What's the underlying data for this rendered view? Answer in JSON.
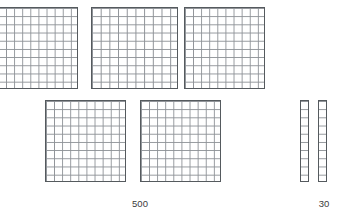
{
  "scene": {
    "title": "Base-ten blocks place value model",
    "background_color": "#ffffff",
    "block_border_color": "#555a5e",
    "block_grid_color": "#8d9196",
    "block_fill_color": "#ffffff",
    "label_color": "#3b3b3b"
  },
  "groups": [
    {
      "id": "hundreds-group",
      "name": "hundreds-flats",
      "piece_type": "flat",
      "piece_value": 100,
      "piece_count": 5,
      "label": "500",
      "label_x": 122,
      "label_y": 198,
      "label_width": 36,
      "grid_rows": 10,
      "grid_cols": 10,
      "pieces": [
        {
          "id": "flat-1",
          "x": -3,
          "y": 7,
          "width": 81,
          "height": 82
        },
        {
          "id": "flat-2",
          "x": 91,
          "y": 7,
          "width": 87,
          "height": 82
        },
        {
          "id": "flat-3",
          "x": 184,
          "y": 7,
          "width": 81,
          "height": 82
        },
        {
          "id": "flat-4",
          "x": 45,
          "y": 100,
          "width": 81,
          "height": 82
        },
        {
          "id": "flat-5",
          "x": 140,
          "y": 100,
          "width": 81,
          "height": 82
        }
      ]
    },
    {
      "id": "tens-group",
      "name": "tens-rods",
      "piece_type": "rod",
      "piece_value": 10,
      "piece_count": 2,
      "label": "30",
      "label_x": 310,
      "label_y": 198,
      "label_width": 28,
      "grid_rows": 10,
      "grid_cols": 1,
      "pieces": [
        {
          "id": "rod-1",
          "x": 300,
          "y": 100,
          "width": 9,
          "height": 82
        },
        {
          "id": "rod-2",
          "x": 318,
          "y": 100,
          "width": 9,
          "height": 82
        }
      ]
    }
  ]
}
